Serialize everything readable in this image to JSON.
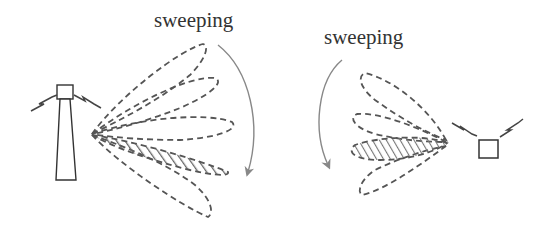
{
  "diagram": {
    "type": "beam-sweeping-illustration",
    "left_panel": {
      "label": "sweeping",
      "transmitter": "base-station-tower",
      "beam_count": 5,
      "selected_beam_index": 3,
      "sweep_direction": "clockwise (top to bottom)"
    },
    "right_panel": {
      "label": "sweeping",
      "transmitter": "user-device",
      "beam_count": 4,
      "selected_beam_index": 2,
      "sweep_direction": "counter-clockwise (top to bottom)"
    },
    "colors": {
      "beam_stroke": "#555555",
      "hatch": "#666666",
      "arrow": "#888888",
      "device_stroke": "#333333",
      "text": "#333333",
      "background": "#ffffff"
    }
  }
}
